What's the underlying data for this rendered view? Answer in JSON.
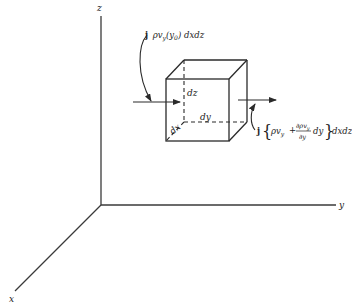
{
  "diagram": {
    "axes": {
      "z_label": "z",
      "y_label": "y",
      "x_label": "x"
    },
    "cube": {
      "dz_label": "dz",
      "dy_label": "dy",
      "dx_label": "dx"
    },
    "inflow": {
      "label_prefix": "j",
      "label_rho_v": "ρv",
      "label_sub": "y",
      "label_arg": "(y",
      "label_arg_sub": "0",
      "label_suffix": ") dxdz"
    },
    "outflow": {
      "label_prefix": "j",
      "label_open": "{",
      "label_rho_v": "ρv",
      "label_sub": "y",
      "label_plus": "+",
      "frac_numerator": "∂ρv",
      "frac_numerator_sub": "y",
      "frac_denominator": "∂y",
      "label_dy": "dy",
      "label_close": "}",
      "label_suffix": "dxdz"
    }
  }
}
